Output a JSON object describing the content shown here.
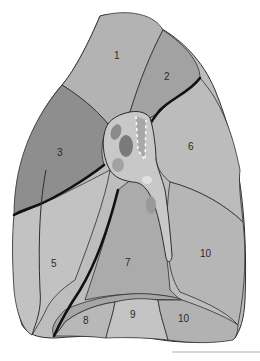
{
  "diagram": {
    "colors": {
      "background": "#ffffff",
      "segment_light": "#bdbdbd",
      "segment_mid": "#ababab",
      "segment_dark": "#8e8e8e",
      "hilum_fill": "#c8c8c8",
      "hilum_dark": "#7a7a7a",
      "outline": "#2e2e2e",
      "fissure": "#111111",
      "scale_bar": "#d6d6d6"
    },
    "segments": [
      {
        "id": "1",
        "label": "1"
      },
      {
        "id": "2",
        "label": "2"
      },
      {
        "id": "3",
        "label": "3"
      },
      {
        "id": "5",
        "label": "5"
      },
      {
        "id": "6",
        "label": "6"
      },
      {
        "id": "7",
        "label": "7"
      },
      {
        "id": "8",
        "label": "8"
      },
      {
        "id": "9",
        "label": "9"
      },
      {
        "id": "10a",
        "label": "10"
      },
      {
        "id": "10b",
        "label": "10"
      }
    ]
  }
}
